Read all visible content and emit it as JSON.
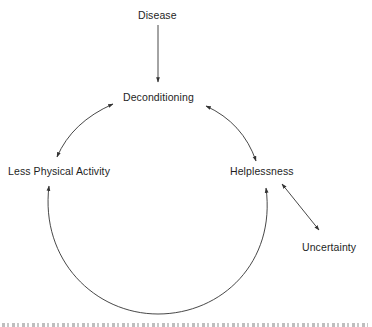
{
  "diagram": {
    "nodes": {
      "disease": {
        "label": "Disease"
      },
      "deconditioning": {
        "label": "Deconditioning"
      },
      "less_physical_activity": {
        "label": "Less Physical Activity"
      },
      "helplessness": {
        "label": "Helplessness"
      },
      "uncertainty": {
        "label": "Uncertainty"
      }
    },
    "edges": [
      {
        "from": "Disease",
        "to": "Deconditioning",
        "type": "one-way",
        "shape": "straight"
      },
      {
        "from": "Deconditioning",
        "to": "Less Physical Activity",
        "type": "two-way",
        "shape": "curved"
      },
      {
        "from": "Deconditioning",
        "to": "Helplessness",
        "type": "two-way",
        "shape": "curved"
      },
      {
        "from": "Less Physical Activity",
        "to": "Helplessness",
        "type": "two-way",
        "shape": "large-arc-below"
      },
      {
        "from": "Helplessness",
        "to": "Uncertainty",
        "type": "two-way",
        "shape": "straight"
      }
    ],
    "colors": {
      "line": "#333333",
      "text": "#1e1e1e",
      "background": "#ffffff"
    }
  }
}
